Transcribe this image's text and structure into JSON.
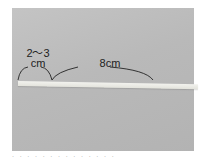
{
  "figure": {
    "measurement_short": {
      "line1": "2～3",
      "line2": "cm"
    },
    "measurement_long": "8cm",
    "caption": "· · · · ·  ·  · ·  · ·  · · · ·"
  },
  "colors": {
    "background": "#bcbcbc",
    "strip": "#eeeee8",
    "ink": "#222222"
  }
}
